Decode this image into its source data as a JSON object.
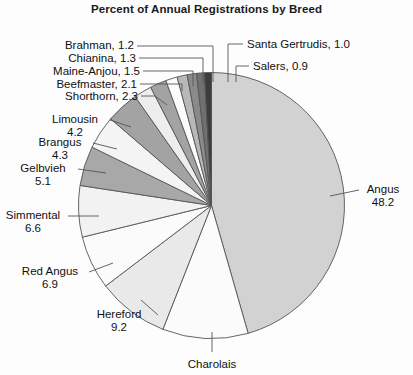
{
  "chart_data": {
    "type": "pie",
    "title": "Percent of Annual Registrations by Breed",
    "xlabel": "",
    "ylabel": "",
    "units": "percent",
    "legend": "none",
    "grid": false,
    "start_angle_deg": 0,
    "direction": "clockwise",
    "categories": [
      "Angus",
      "Charolais",
      "Hereford",
      "Red Angus",
      "Simmental",
      "Gelbvieh",
      "Brangus",
      "Limousin",
      "Shorthorn",
      "Beefmaster",
      "Maine-Anjou",
      "Chianina",
      "Brahman",
      "Santa Gertrudis",
      "Salers"
    ],
    "values": [
      48.2,
      11.0,
      9.2,
      6.9,
      6.6,
      5.1,
      4.3,
      4.2,
      2.3,
      2.1,
      1.5,
      1.3,
      1.2,
      1.0,
      0.9
    ],
    "slices": [
      {
        "name": "Angus",
        "value": 48.2,
        "value_text": "48.2",
        "fill": "#d2d2d2"
      },
      {
        "name": "Charolais",
        "value": 11.0,
        "value_text": "",
        "fill": "#fbfbfb"
      },
      {
        "name": "Hereford",
        "value": 9.2,
        "value_text": "9.2",
        "fill": "#e9e9e9"
      },
      {
        "name": "Red Angus",
        "value": 6.9,
        "value_text": "6.9",
        "fill": "#fbfbfb"
      },
      {
        "name": "Simmental",
        "value": 6.6,
        "value_text": "6.6",
        "fill": "#f2f2f2"
      },
      {
        "name": "Gelbvieh",
        "value": 5.1,
        "value_text": "5.1",
        "fill": "#a8a8a8"
      },
      {
        "name": "Brangus",
        "value": 4.3,
        "value_text": "4.3",
        "fill": "#f4f4f4"
      },
      {
        "name": "Limousin",
        "value": 4.2,
        "value_text": "4.2",
        "fill": "#a3a3a3"
      },
      {
        "name": "Shorthorn",
        "value": 2.3,
        "value_text": "2.3",
        "fill": "#ededed"
      },
      {
        "name": "Beefmaster",
        "value": 2.1,
        "value_text": "2.1",
        "fill": "#a3a3a3"
      },
      {
        "name": "Maine-Anjou",
        "value": 1.5,
        "value_text": "1.5",
        "fill": "#fbfbfb"
      },
      {
        "name": "Chianina",
        "value": 1.3,
        "value_text": "1.3",
        "fill": "#b8b8b8"
      },
      {
        "name": "Brahman",
        "value": 1.2,
        "value_text": "1.2",
        "fill": "#8a8a8a"
      },
      {
        "name": "Santa Gertrudis",
        "value": 1.0,
        "value_text": "1.0",
        "fill": "#707070"
      },
      {
        "name": "Salers",
        "value": 0.9,
        "value_text": "0.9",
        "fill": "#3c3c3c"
      }
    ]
  },
  "labels": {
    "brahman": {
      "text": "Brahman, 1.2"
    },
    "chianina": {
      "text": "Chianina, 1.3"
    },
    "maine_anjou": {
      "text": "Maine-Anjou, 1.5"
    },
    "beefmaster": {
      "text": "Beefmaster, 2.1"
    },
    "shorthorn": {
      "text": "Shorthorn, 2.3"
    },
    "santa_gertrudis": {
      "text": "Santa Gertrudis, 1.0"
    },
    "salers": {
      "text": "Salers, 0.9"
    },
    "limousin": {
      "name": "Limousin",
      "value": "4.2"
    },
    "brangus": {
      "name": "Brangus",
      "value": "4.3"
    },
    "gelbvieh": {
      "name": "Gelbvieh",
      "value": "5.1"
    },
    "simmental": {
      "name": "Simmental",
      "value": "6.6"
    },
    "red_angus": {
      "name": "Red Angus",
      "value": "6.9"
    },
    "hereford": {
      "name": "Hereford",
      "value": "9.2"
    },
    "charolais": {
      "name": "Charolais"
    },
    "angus": {
      "name": "Angus",
      "value": "48.2"
    }
  },
  "colors": {
    "background": "#fdfdfd",
    "text": "#111111",
    "stroke": "#555555"
  }
}
